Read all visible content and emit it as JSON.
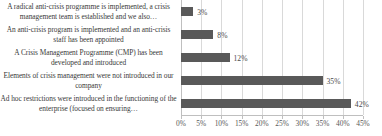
{
  "chart_data": {
    "type": "bar",
    "orientation": "horizontal",
    "title": "",
    "subtitle": "",
    "xlabel": "",
    "ylabel": "",
    "xlim": [
      0,
      45
    ],
    "xtick_step": 5,
    "grid": true,
    "legend": false,
    "bar_color": "#595959",
    "gridline_color": "#d9d9d9",
    "label_color": "#3a3a3a",
    "value_label_color": "#4a4a4a",
    "value_suffix": "%",
    "categories": [
      "A radical anti-crisis programme is implemented, a crisis management team is established and we also…",
      "An anti-crisis program is implemented and an anti-crisis staff has been appointed",
      "A Crisis Management Programme (CMP) has been developed and introduced",
      "Elements of crisis management were not introduced in our company",
      "Ad hoc restrictions were introduced in the functioning of the enterprise (focused on ensuring…"
    ],
    "values": [
      3,
      8,
      12,
      35,
      42
    ],
    "value_labels": [
      "3%",
      "8%",
      "12%",
      "35%",
      "42%"
    ],
    "xtick_labels": [
      "0%",
      "5%",
      "10%",
      "15%",
      "20%",
      "25%",
      "30%",
      "35%",
      "40%",
      "45%"
    ],
    "xtick_values": [
      0,
      5,
      10,
      15,
      20,
      25,
      30,
      35,
      40,
      45
    ]
  }
}
